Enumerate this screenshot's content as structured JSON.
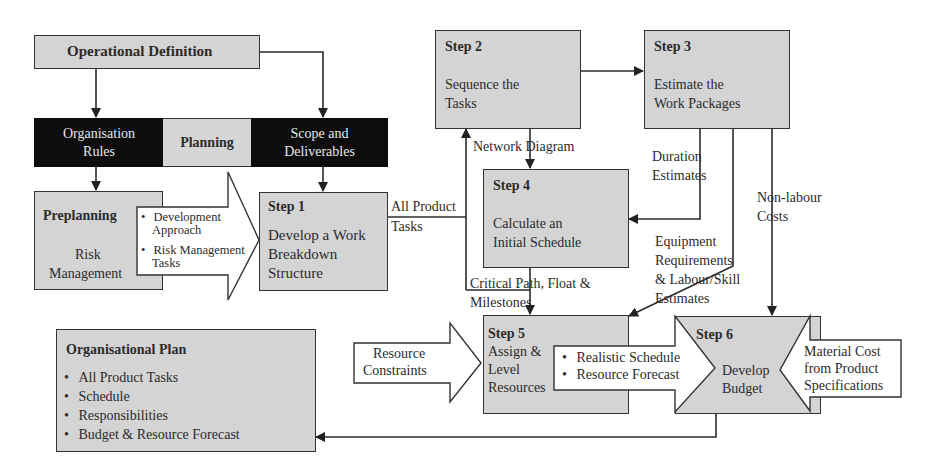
{
  "diagram": {
    "operational_definition": "Operational Definition",
    "planning_band": {
      "left": "Organisation Rules",
      "left_line1": "Organisation",
      "left_line2": "Rules",
      "middle": "Planning",
      "right_line1": "Scope and",
      "right_line2": "Deliverables"
    },
    "preplanning": {
      "title": "Preplanning",
      "line1": "Risk",
      "line2": "Management"
    },
    "preplanning_outputs": {
      "item1_line1": "Development",
      "item1_line2": "Approach",
      "item2_line1": "Risk Management",
      "item2_line2": "Tasks"
    },
    "steps": [
      {
        "title": "Step 1",
        "line1": "Develop a Work",
        "line2": "Breakdown",
        "line3": "Structure"
      },
      {
        "title": "Step 2",
        "line1": "Sequence the",
        "line2": "Tasks"
      },
      {
        "title": "Step 3",
        "line1": "Estimate the",
        "line2": "Work Packages"
      },
      {
        "title": "Step 4",
        "line1": "Calculate an",
        "line2": "Initial Schedule"
      },
      {
        "title": "Step 5",
        "line1": "Assign &",
        "line2": "Level",
        "line3": "Resources"
      },
      {
        "title": "Step 6",
        "line1": "Develop",
        "line2": "Budget"
      }
    ],
    "flow_labels": {
      "all_product_tasks_1": "All Product",
      "all_product_tasks_2": "Tasks",
      "network_diagram": "Network Diagram",
      "duration_estimates_1": "Duration",
      "duration_estimates_2": "Estimates",
      "non_labour_costs_1": "Non-labour",
      "non_labour_costs_2": "Costs",
      "equipment_1": "Equipment",
      "equipment_2": "Requirements",
      "equipment_3": "& Labour/Skill",
      "equipment_4": "Estimates",
      "critical_path_1": "Critical Path, Float &",
      "critical_path_2": "Milestones"
    },
    "resource_constraints": {
      "line1": "Resource",
      "line2": "Constraints"
    },
    "step5_outputs": [
      "Realistic Schedule",
      "Resource Forecast"
    ],
    "material_cost": {
      "line1": "Material Cost",
      "line2": "from Product",
      "line3": "Specifications"
    },
    "organisational_plan": {
      "title": "Organisational Plan",
      "items": [
        "All Product Tasks",
        "Schedule",
        "Responsibilities",
        "Budget & Resource Forecast"
      ]
    }
  },
  "colors": {
    "box_fill": "#d4d4d4",
    "dark_fill": "#0d0d0d",
    "line": "#2b2b2b",
    "arrow_fill": "#ffffff"
  }
}
